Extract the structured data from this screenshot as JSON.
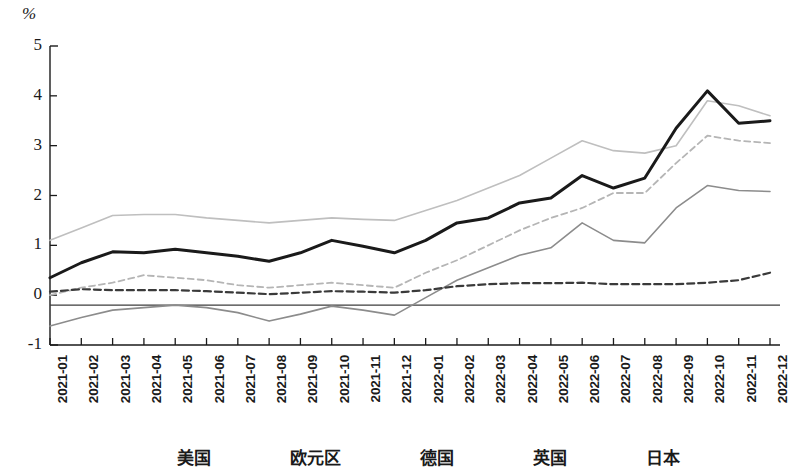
{
  "axis": {
    "unit": "%",
    "y_ticks": [
      "5",
      "4",
      "3",
      "2",
      "1",
      "0",
      "-1"
    ],
    "x_labels": [
      "2021-01",
      "2021-02",
      "2021-03",
      "2021-04",
      "2021-05",
      "2021-06",
      "2021-07",
      "2021-08",
      "2021-09",
      "2021-10",
      "2021-11",
      "2021-12",
      "2022-01",
      "2022-02",
      "2022-03",
      "2022-04",
      "2022-05",
      "2022-06",
      "2022-07",
      "2022-08",
      "2022-09",
      "2022-10",
      "2022-11",
      "2022-12"
    ]
  },
  "legend": {
    "items": [
      {
        "label": "美国",
        "color": "#bfbfbf",
        "style": "solid",
        "width": 1.6
      },
      {
        "label": "欧元区",
        "color": "#b5b5b5",
        "style": "dashed",
        "width": 1.8
      },
      {
        "label": "德国",
        "color": "#8c8c8c",
        "style": "solid",
        "width": 1.6
      },
      {
        "label": "英国",
        "color": "#1a1a1a",
        "style": "solid",
        "width": 3.0
      },
      {
        "label": "日本",
        "color": "#3a3a3a",
        "style": "dashed",
        "width": 2.2
      }
    ]
  },
  "chart_data": {
    "type": "line",
    "title": "",
    "xlabel": "",
    "ylabel": "%",
    "ylim": [
      -1,
      5
    ],
    "y_tick_values": [
      5,
      4,
      3,
      2,
      1,
      0,
      -1
    ],
    "grid": false,
    "legend_position": "bottom",
    "reference_line": -0.2,
    "x": [
      "2021-01",
      "2021-02",
      "2021-03",
      "2021-04",
      "2021-05",
      "2021-06",
      "2021-07",
      "2021-08",
      "2021-09",
      "2021-10",
      "2021-11",
      "2021-12",
      "2022-01",
      "2022-02",
      "2022-03",
      "2022-04",
      "2022-05",
      "2022-06",
      "2022-07",
      "2022-08",
      "2022-09",
      "2022-10",
      "2022-11",
      "2022-12"
    ],
    "series": [
      {
        "name": "美国",
        "color": "#bfbfbf",
        "style": "solid",
        "width": 1.6,
        "values": [
          1.1,
          1.35,
          1.6,
          1.62,
          1.62,
          1.55,
          1.5,
          1.45,
          1.5,
          1.55,
          1.52,
          1.5,
          1.7,
          1.9,
          2.15,
          2.4,
          2.75,
          3.1,
          2.9,
          2.85,
          3.0,
          3.9,
          3.8,
          3.6
        ]
      },
      {
        "name": "欧元区",
        "color": "#b5b5b5",
        "style": "dashed",
        "width": 1.8,
        "values": [
          0.0,
          0.15,
          0.25,
          0.4,
          0.35,
          0.3,
          0.2,
          0.15,
          0.2,
          0.25,
          0.2,
          0.15,
          0.45,
          0.7,
          1.0,
          1.3,
          1.55,
          1.75,
          2.05,
          2.05,
          2.65,
          3.2,
          3.1,
          3.05
        ]
      },
      {
        "name": "德国",
        "color": "#8c8c8c",
        "style": "solid",
        "width": 1.6,
        "values": [
          -0.62,
          -0.45,
          -0.3,
          -0.25,
          -0.2,
          -0.25,
          -0.35,
          -0.52,
          -0.38,
          -0.22,
          -0.3,
          -0.4,
          -0.05,
          0.3,
          0.55,
          0.8,
          0.95,
          1.45,
          1.1,
          1.05,
          1.75,
          2.2,
          2.1,
          2.08
        ]
      },
      {
        "name": "英国",
        "color": "#1a1a1a",
        "style": "solid",
        "width": 3.0,
        "values": [
          0.35,
          0.65,
          0.87,
          0.85,
          0.92,
          0.85,
          0.78,
          0.68,
          0.85,
          1.1,
          0.98,
          0.85,
          1.1,
          1.45,
          1.55,
          1.85,
          1.95,
          2.4,
          2.15,
          2.35,
          3.35,
          4.1,
          3.45,
          3.5
        ]
      },
      {
        "name": "日本",
        "color": "#3a3a3a",
        "style": "dashed",
        "width": 2.2,
        "values": [
          0.07,
          0.12,
          0.1,
          0.1,
          0.1,
          0.08,
          0.05,
          0.02,
          0.05,
          0.08,
          0.07,
          0.05,
          0.1,
          0.18,
          0.22,
          0.24,
          0.24,
          0.25,
          0.22,
          0.22,
          0.22,
          0.25,
          0.3,
          0.45
        ]
      }
    ]
  }
}
